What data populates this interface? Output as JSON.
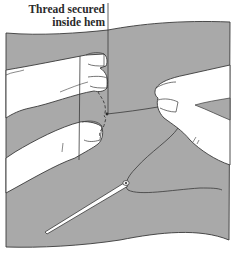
{
  "figure": {
    "label_line1": "Thread secured",
    "label_line2": "inside hem",
    "colors": {
      "fabric": "#a9a9a9",
      "skin": "#ffffff",
      "outline": "#3a3a3a",
      "background": "#ffffff"
    },
    "elements": [
      "fabric",
      "left-hand",
      "right-hand",
      "thread",
      "needle",
      "hem-stitch",
      "leader-line"
    ]
  }
}
